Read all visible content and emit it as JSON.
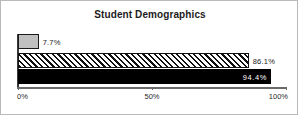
{
  "chart_data": {
    "type": "bar",
    "orientation": "horizontal",
    "title": "Student Demographics",
    "xlabel": "",
    "ylabel": "",
    "xlim": [
      0,
      100
    ],
    "grid": false,
    "legend": "none",
    "categories": [
      "series-1",
      "series-2",
      "series-3"
    ],
    "values": [
      7.7,
      86.1,
      94.4
    ],
    "data_labels": [
      "7.7%",
      "86.1%",
      "94.4%"
    ],
    "bars": [
      {
        "value": 7.7,
        "label": "7.7%",
        "fill": "gray",
        "fill_color": "#c0c0c0",
        "label_position": "outside"
      },
      {
        "value": 86.1,
        "label": "86.1%",
        "fill": "diagonal-hatch",
        "fill_color": "#ffffff",
        "label_position": "outside"
      },
      {
        "value": 94.4,
        "label": "94.4%",
        "fill": "solid-black",
        "fill_color": "#000000",
        "label_position": "inside"
      }
    ],
    "xticks": [
      0,
      50,
      100
    ],
    "xtick_labels": [
      "0%",
      "50%",
      "100%"
    ]
  },
  "colors": {
    "frame_border": "#b9b9b9",
    "axis": "#3a3a3a",
    "title_text": "#1c1c1c",
    "inside_label_text": "#ffffff"
  }
}
